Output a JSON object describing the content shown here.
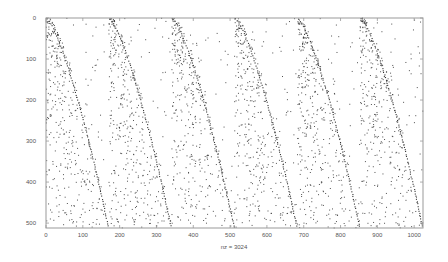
{
  "chart_data": {
    "type": "scatter",
    "subtype": "sparsity-pattern (spy plot)",
    "title": "",
    "xlabel": "nz = 3024",
    "ylabel": "",
    "nonzero_count": 3024,
    "x_axis": {
      "position": "top-ticks-and-bottom-labels",
      "range": [
        0,
        1024
      ],
      "ticks": [
        0,
        100,
        200,
        300,
        400,
        500,
        600,
        700,
        800,
        900,
        1000
      ],
      "tick_labels": [
        "0",
        "100",
        "200",
        "300",
        "400",
        "500",
        "600",
        "700",
        "800",
        "900",
        "1000"
      ]
    },
    "y_axis": {
      "direction": "reversed (0 at top)",
      "range": [
        0,
        512
      ],
      "ticks": [
        0,
        100,
        200,
        300,
        400,
        500
      ],
      "tick_labels": [
        "0",
        "100",
        "200",
        "300",
        "400",
        "500"
      ]
    },
    "grid": false,
    "legend": null,
    "marker_color": "#333333",
    "frame_color": "#999999",
    "data_note": "The figure reports nz = 3024 nonzeros, but individual coordinates cannot be read at this resolution. Plotted points are a procedural approximation that mimics the visible structure; they are not measured data.",
    "structure": {
      "description": "6 column blocks, each with a dense concave diagonal arc from the block's top-left toward the bottom, plus scattered nonzeros that thin out above the arc",
      "block_count": 6,
      "block_width_units": 170.67,
      "block_starts_x": [
        0,
        170.67,
        341.33,
        512,
        682.67,
        853.33
      ],
      "arc_start": {
        "x_offset": 0,
        "y": 0
      },
      "arc_end": {
        "x_offset_estimated": 170,
        "y": 512
      },
      "arc_shape": "concave (shallower near top, steeper near bottom) — estimated",
      "background_points_per_block_estimated": 420,
      "arc_points_per_block_estimated": 85
    }
  }
}
